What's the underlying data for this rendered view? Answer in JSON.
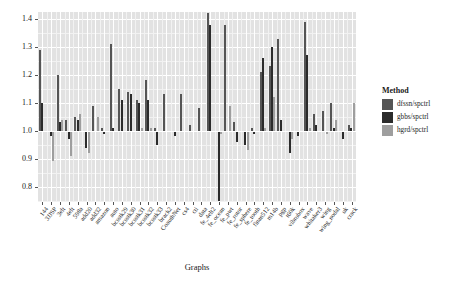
{
  "chart_data": {
    "type": "bar",
    "title": "",
    "xlabel": "Graphs",
    "ylabel": "Cut ratio",
    "ylim": [
      0.745,
      1.425
    ],
    "yticks": [
      0.8,
      0.9,
      1.0,
      1.1,
      1.2,
      1.3,
      1.4
    ],
    "ytick_labels": [
      "0.8",
      "0.9",
      "1.0",
      "1.1",
      "1.2",
      "1.3",
      "1.4"
    ],
    "baseline": 1.0,
    "grid": true,
    "legend_position": "right",
    "legend_title": "Method",
    "categories": [
      "144",
      "3JJSP",
      "3elt",
      "4elt",
      "598a",
      "add20",
      "add32",
      "amazon",
      "auto",
      "bcsstk29",
      "bcsstk30",
      "bcsstk31",
      "bcsstk32",
      "bcsstk33",
      "brack2",
      "CoauthNet",
      "cs4",
      "cti",
      "data",
      "fe_4elt2",
      "fe_ocean",
      "fe_pwt",
      "fe_rotor",
      "fe_sphere",
      "fe_tooth",
      "finan512",
      "m14b",
      "pgp",
      "t60k",
      "vibrobox",
      "wave",
      "whitaker3",
      "wing",
      "wing_nodal",
      "uk",
      "crack"
    ],
    "series": [
      {
        "name": "dfssn/spctrl",
        "color": "#555555",
        "values": [
          1.29,
          1.0,
          1.2,
          1.04,
          1.05,
          1.0,
          1.09,
          1.01,
          1.31,
          1.15,
          1.14,
          1.11,
          1.18,
          1.01,
          1.13,
          1.0,
          1.13,
          1.02,
          1.08,
          1.42,
          1.0,
          1.38,
          1.03,
          1.0,
          1.01,
          1.21,
          1.23,
          1.33,
          1.0,
          1.0,
          1.39,
          1.06,
          1.07,
          1.1,
          1.0,
          1.02
        ]
      },
      {
        "name": "gbbs/spctrl",
        "color": "#2b2b2b",
        "values": [
          1.1,
          0.98,
          1.03,
          0.97,
          1.04,
          0.94,
          1.0,
          0.99,
          1.01,
          1.11,
          1.13,
          1.1,
          1.11,
          0.95,
          1.0,
          0.98,
          1.0,
          1.0,
          1.0,
          1.38,
          0.75,
          1.0,
          0.96,
          0.95,
          0.99,
          1.26,
          1.3,
          1.04,
          0.92,
          0.98,
          1.27,
          1.02,
          1.0,
          1.01,
          0.97,
          1.01
        ]
      },
      {
        "name": "hgrd/spctrl",
        "color": "#9e9e9e",
        "values": [
          1.0,
          0.89,
          1.04,
          0.91,
          1.06,
          0.92,
          1.05,
          1.0,
          1.0,
          1.0,
          1.0,
          1.01,
          1.01,
          1.0,
          1.0,
          1.0,
          1.0,
          1.0,
          1.0,
          1.0,
          0.99,
          1.09,
          1.0,
          0.93,
          1.0,
          1.01,
          1.12,
          1.0,
          0.97,
          1.0,
          1.01,
          1.0,
          0.99,
          1.04,
          1.0,
          1.1
        ]
      }
    ]
  }
}
